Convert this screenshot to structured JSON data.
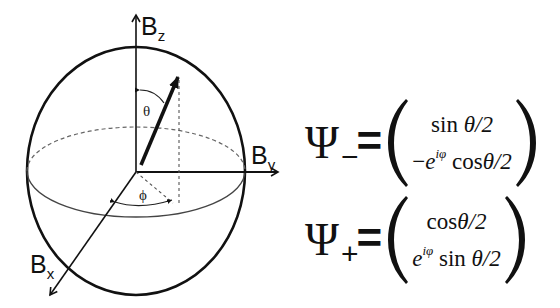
{
  "diagram": {
    "axes": {
      "z": {
        "label": "B",
        "subscript": "z"
      },
      "y": {
        "label": "B",
        "subscript": "y"
      },
      "x": {
        "label": "B",
        "subscript": "x"
      }
    },
    "angles": {
      "polar": "θ",
      "azimuthal": "ϕ"
    }
  },
  "equations": {
    "psi_minus": {
      "symbol": "Ψ",
      "subscript": "−",
      "equals": "=",
      "row1": {
        "func": "sin",
        "arg": "θ/2"
      },
      "row2": {
        "sign": "−",
        "exp_base": "e",
        "exp_power": "iφ",
        "func": "cos",
        "arg": "θ/2"
      }
    },
    "psi_plus": {
      "symbol": "Ψ",
      "subscript": "+",
      "equals": "=",
      "row1": {
        "func": "cos",
        "arg": "θ/2"
      },
      "row2": {
        "sign": "",
        "exp_base": "e",
        "exp_power": "iφ",
        "func": "sin",
        "arg": "θ/2"
      }
    }
  },
  "colors": {
    "ink": "#111111",
    "dashed": "#555555",
    "background": "#ffffff"
  }
}
